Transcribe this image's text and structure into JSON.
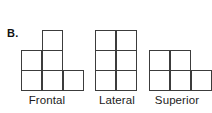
{
  "figure": {
    "panel_letter": "B.",
    "background_color": "#ffffff",
    "stroke_color": "#3c3c3c",
    "cell_fill_color": "#ffffff",
    "cell_size_px": 21,
    "views": [
      {
        "id": "frontal",
        "label": "Frontal",
        "cell_count": 6,
        "grid_cols": 3,
        "grid_rows": 3,
        "cells": [
          {
            "col": 1,
            "row": 0,
            "x": 42,
            "y": 30
          },
          {
            "col": 0,
            "row": 1,
            "x": 21,
            "y": 50
          },
          {
            "col": 1,
            "row": 1,
            "x": 42,
            "y": 50
          },
          {
            "col": 0,
            "row": 2,
            "x": 21,
            "y": 70
          },
          {
            "col": 1,
            "row": 2,
            "x": 42,
            "y": 70
          },
          {
            "col": 2,
            "row": 2,
            "x": 63,
            "y": 70
          }
        ]
      },
      {
        "id": "lateral",
        "label": "Lateral",
        "cell_count": 6,
        "grid_cols": 2,
        "grid_rows": 3,
        "cells": [
          {
            "col": 0,
            "row": 0,
            "x": 3,
            "y": 30
          },
          {
            "col": 1,
            "row": 0,
            "x": 24,
            "y": 30
          },
          {
            "col": 0,
            "row": 1,
            "x": 3,
            "y": 50
          },
          {
            "col": 1,
            "row": 1,
            "x": 24,
            "y": 50
          },
          {
            "col": 0,
            "row": 2,
            "x": 3,
            "y": 70
          },
          {
            "col": 1,
            "row": 2,
            "x": 24,
            "y": 70
          }
        ]
      },
      {
        "id": "superior",
        "label": "Superior",
        "cell_count": 5,
        "grid_cols": 3,
        "grid_rows": 2,
        "cells": [
          {
            "col": 0,
            "row": 0,
            "x": 7,
            "y": 50
          },
          {
            "col": 1,
            "row": 0,
            "x": 28,
            "y": 50
          },
          {
            "col": 0,
            "row": 1,
            "x": 7,
            "y": 70
          },
          {
            "col": 1,
            "row": 1,
            "x": 28,
            "y": 70
          },
          {
            "col": 2,
            "row": 1,
            "x": 49,
            "y": 70
          }
        ]
      }
    ]
  }
}
